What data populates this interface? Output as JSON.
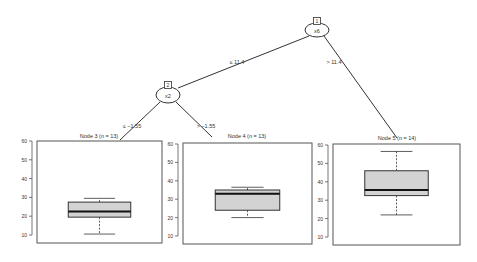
{
  "tree": {
    "inner_nodes": [
      {
        "id": "1",
        "variable": "x6"
      },
      {
        "id": "2",
        "variable": "x2"
      }
    ],
    "edges": [
      {
        "from": "1",
        "to": "2",
        "label": "≤ 11.4"
      },
      {
        "from": "1",
        "to": "5",
        "label": "> 11.4"
      },
      {
        "from": "2",
        "to": "3",
        "label": "≤ −1.55"
      },
      {
        "from": "2",
        "to": "4",
        "label": "> −1.55"
      }
    ],
    "terminal_nodes": [
      {
        "id": "3",
        "title": "Node 3  (n = 13)",
        "n": 13
      },
      {
        "id": "4",
        "title": "Node 4  (n = 13)",
        "n": 13
      },
      {
        "id": "5",
        "title": "Node 5  (n = 14)",
        "n": 14
      }
    ]
  },
  "chart_data": {
    "type": "boxplot",
    "title": "",
    "ylim": [
      6,
      61
    ],
    "yticks": [
      10,
      20,
      30,
      40,
      50,
      60
    ],
    "ytick_labels": [
      "10",
      "20",
      "30",
      "40",
      "50",
      "60"
    ],
    "panels": [
      {
        "node": "Node 3",
        "n": 13,
        "whisker_low": 10.5,
        "q1": 19.5,
        "median": 22.5,
        "q3": 27.5,
        "whisker_high": 29.5
      },
      {
        "node": "Node 4",
        "n": 13,
        "whisker_low": 20,
        "q1": 24,
        "median": 33,
        "q3": 35,
        "whisker_high": 36.5
      },
      {
        "node": "Node 5",
        "n": 14,
        "whisker_low": 22,
        "q1": 32.5,
        "median": 35.5,
        "q3": 46,
        "whisker_high": 56.5
      }
    ]
  }
}
